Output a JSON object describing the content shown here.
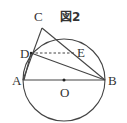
{
  "figure": {
    "title": "図2",
    "labels": {
      "A": "A",
      "B": "B",
      "C": "C",
      "D": "D",
      "E": "E",
      "O": "O"
    },
    "elements": [
      "circle centered at O with diameter AB",
      "segment AB (diameter)",
      "segment AC",
      "segment CB",
      "segment DB",
      "dashed segment DE (parallel to AB)",
      "point O marked as center"
    ],
    "colors": {
      "stroke": "#444444",
      "background": "#ffffff"
    }
  }
}
